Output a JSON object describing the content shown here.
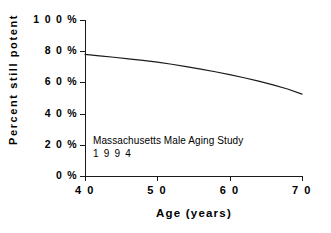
{
  "chart_data": {
    "type": "line",
    "title": "",
    "xlabel": "Age (years)",
    "ylabel": "Percent still potent",
    "xlim": [
      40,
      70
    ],
    "ylim": [
      0,
      100
    ],
    "grid": false,
    "legend": null,
    "xticks": [
      40,
      50,
      70,
      60
    ],
    "xtick_labels": [
      "4 0",
      "5 0",
      "6 0",
      "7 0"
    ],
    "ytick_values": [
      0,
      20,
      40,
      60,
      80,
      100
    ],
    "ytick_labels": [
      "0 %",
      "2 0 %",
      "4 0 %",
      "6 0 %",
      "8 0 %",
      "1 0 0 %"
    ],
    "x": [
      40,
      42,
      44,
      46,
      48,
      50,
      52,
      54,
      56,
      58,
      60,
      62,
      64,
      66,
      68,
      70
    ],
    "series": [
      {
        "name": "Percent still potent",
        "color": "#1a1a1a",
        "values": [
          78.0,
          77.0,
          76.1,
          75.1,
          74.1,
          73.0,
          71.6,
          70.1,
          68.5,
          66.8,
          65.0,
          63.0,
          60.8,
          58.4,
          55.8,
          52.5
        ]
      }
    ],
    "annotations": [
      {
        "line1": "Massachusetts Male Aging Study",
        "line2": "1 9 9 4"
      }
    ]
  },
  "axes": {
    "ylabel": "Percent still potent",
    "xlabel": "Age (years)",
    "ytick_labels": [
      "1 0 0 %",
      "8 0 %",
      "6 0 %",
      "4 0 %",
      "2 0 %",
      "0 %"
    ],
    "xtick_labels": [
      "4 0",
      "5 0",
      "6 0",
      "7 0"
    ]
  },
  "annotation": {
    "line1": "Massachusetts Male Aging Study",
    "line2": "1 9 9 4"
  },
  "colors": {
    "ink": "#1a1a1a",
    "background": "#ffffff"
  }
}
